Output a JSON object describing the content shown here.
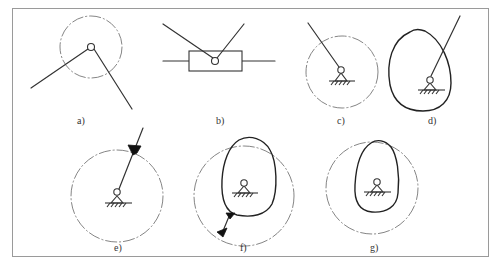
{
  "figure": {
    "type": "kinematic-diagram",
    "panels": [
      {
        "id": "a",
        "label": "a)",
        "description": "two links joined at a revolute pin, dash-dot circle around pin"
      },
      {
        "id": "b",
        "label": "b)",
        "description": "two links joined at pin inside a sliding block on a horizontal guide"
      },
      {
        "id": "c",
        "label": "c)",
        "description": "link pinned to fixed ground support, dash-dot circle"
      },
      {
        "id": "d",
        "label": "d)",
        "description": "link pinned to ground, enclosed by closed solid curve"
      },
      {
        "id": "e",
        "label": "e)",
        "description": "link pinned to ground, dash-dot circle, black weld triangle at intersection"
      },
      {
        "id": "f",
        "label": "f)",
        "description": "ground pin inside closed curve, curve connected to dash-dot circle with black weld marks"
      },
      {
        "id": "g",
        "label": "g)",
        "description": "ground pin inside closed curve, surrounded by dash-dot circle"
      }
    ]
  }
}
